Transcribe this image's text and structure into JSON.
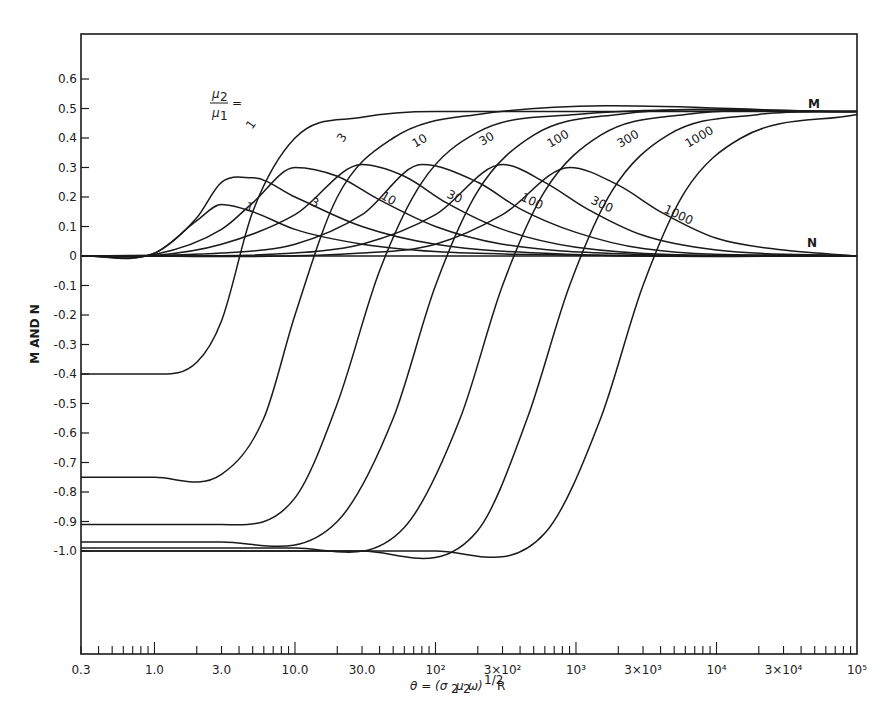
{
  "chart_data": {
    "type": "line",
    "title": "",
    "xlabel": "θ = (σ₂μ₂ω)^1/2 R",
    "ylabel": "M AND N",
    "xscale": "log",
    "xlim": [
      0.3,
      100000
    ],
    "ylim": [
      -1.4,
      0.7
    ],
    "grid": false,
    "legend_position": "inline",
    "legend_title": "μ₂/μ₁ =",
    "x_tick_labels": [
      "0.3",
      "1.0",
      "3.0",
      "10.0",
      "30.0",
      "10²",
      "3×10²",
      "10³",
      "3×10³",
      "10⁴",
      "3×10⁴",
      "10⁵"
    ],
    "x_tick_values": [
      0.3,
      1,
      3,
      10,
      30,
      100,
      300,
      1000,
      3000,
      10000,
      30000,
      100000
    ],
    "y_tick_labels": [
      "0.6",
      "0.5",
      "0.4",
      "0.3",
      "0.2",
      "0.1",
      "0",
      "-0.1",
      "-0.2",
      "-0.3",
      "-0.4",
      "-0.5",
      "-0.6",
      "-0.7",
      "-0.8",
      "-0.9",
      "-1.0"
    ],
    "y_tick_values": [
      0.6,
      0.5,
      0.4,
      0.3,
      0.2,
      0.1,
      0,
      -0.1,
      -0.2,
      -0.3,
      -0.4,
      -0.5,
      -0.6,
      -0.7,
      -0.8,
      -0.9,
      -1.0
    ],
    "curve_family_labels": [
      "M",
      "N"
    ],
    "ratios": [
      "1",
      "3",
      "10",
      "30",
      "100",
      "300",
      "1000"
    ],
    "series": [
      {
        "name": "M, μ₂/μ₁=1",
        "family": "M",
        "ratio": "1",
        "x": [
          0.3,
          1,
          2,
          3,
          5,
          10,
          30,
          100,
          100000.0
        ],
        "values": [
          -0.4,
          -0.4,
          -0.36,
          -0.22,
          0.15,
          0.4,
          0.47,
          0.49,
          0.49
        ]
      },
      {
        "name": "M, μ₂/μ₁=3",
        "family": "M",
        "ratio": "3",
        "x": [
          0.3,
          1,
          3,
          6,
          10,
          20,
          50,
          200,
          100000.0
        ],
        "values": [
          -0.75,
          -0.75,
          -0.74,
          -0.55,
          -0.2,
          0.2,
          0.4,
          0.48,
          0.49
        ]
      },
      {
        "name": "M, μ₂/μ₁=10",
        "family": "M",
        "ratio": "10",
        "x": [
          0.3,
          3,
          10,
          20,
          40,
          80,
          200,
          1000,
          100000.0
        ],
        "values": [
          -0.91,
          -0.91,
          -0.82,
          -0.5,
          -0.05,
          0.25,
          0.42,
          0.48,
          0.49
        ]
      },
      {
        "name": "M, μ₂/μ₁=30",
        "family": "M",
        "ratio": "30",
        "x": [
          0.3,
          3,
          20,
          50,
          100,
          200,
          500,
          2000,
          100000.0
        ],
        "values": [
          -0.97,
          -0.97,
          -0.9,
          -0.55,
          -0.1,
          0.22,
          0.41,
          0.48,
          0.49
        ]
      },
      {
        "name": "M, μ₂/μ₁=100",
        "family": "M",
        "ratio": "100",
        "x": [
          0.3,
          10,
          60,
          150,
          300,
          600,
          1500,
          6000,
          100000.0
        ],
        "values": [
          -0.99,
          -0.99,
          -0.92,
          -0.55,
          -0.1,
          0.22,
          0.41,
          0.48,
          0.49
        ]
      },
      {
        "name": "M, μ₂/μ₁=300",
        "family": "M",
        "ratio": "300",
        "x": [
          0.3,
          30,
          200,
          450,
          900,
          1800,
          4500,
          20000,
          100000.0
        ],
        "values": [
          -1.0,
          -1.0,
          -0.93,
          -0.55,
          -0.1,
          0.22,
          0.41,
          0.48,
          0.49
        ]
      },
      {
        "name": "M, μ₂/μ₁=1000",
        "family": "M",
        "ratio": "1000",
        "x": [
          0.3,
          100,
          600,
          1500,
          3000,
          6000,
          15000,
          100000.0
        ],
        "values": [
          -1.0,
          -1.0,
          -0.94,
          -0.55,
          -0.1,
          0.22,
          0.4,
          0.48
        ]
      },
      {
        "name": "N, μ₂/μ₁=1",
        "family": "N",
        "ratio": "1",
        "x": [
          0.3,
          1,
          2,
          3,
          5,
          10,
          30,
          100,
          1000,
          100000.0
        ],
        "values": [
          0,
          0.01,
          0.12,
          0.175,
          0.15,
          0.09,
          0.04,
          0.015,
          0.003,
          0
        ]
      },
      {
        "name": "N, μ₂/μ₁=3",
        "family": "N",
        "ratio": "3",
        "x": [
          0.3,
          1,
          2,
          3,
          5,
          10,
          30,
          100,
          1000,
          100000.0
        ],
        "values": [
          0,
          0.01,
          0.13,
          0.25,
          0.265,
          0.2,
          0.1,
          0.04,
          0.005,
          0
        ]
      },
      {
        "name": "N, μ₂/μ₁=10",
        "family": "N",
        "ratio": "10",
        "x": [
          0.3,
          1,
          3,
          5,
          10,
          20,
          40,
          100,
          300,
          3000,
          100000.0
        ],
        "values": [
          0,
          0.005,
          0.09,
          0.18,
          0.3,
          0.27,
          0.19,
          0.1,
          0.04,
          0.005,
          0
        ]
      },
      {
        "name": "N, μ₂/μ₁=30",
        "family": "N",
        "ratio": "30",
        "x": [
          0.3,
          1,
          3,
          10,
          30,
          60,
          120,
          300,
          1000,
          100000.0
        ],
        "values": [
          0,
          0.002,
          0.04,
          0.14,
          0.31,
          0.27,
          0.18,
          0.09,
          0.03,
          0
        ]
      },
      {
        "name": "N, μ₂/μ₁=100",
        "family": "N",
        "ratio": "100",
        "x": [
          0.3,
          3,
          10,
          30,
          80,
          200,
          400,
          1000,
          3000,
          100000.0
        ],
        "values": [
          0,
          0.01,
          0.04,
          0.14,
          0.31,
          0.25,
          0.16,
          0.08,
          0.025,
          0
        ]
      },
      {
        "name": "N, μ₂/μ₁=300",
        "family": "N",
        "ratio": "300",
        "x": [
          0.3,
          10,
          30,
          100,
          300,
          600,
          1200,
          3000,
          10000,
          100000.0
        ],
        "values": [
          0,
          0.01,
          0.04,
          0.14,
          0.31,
          0.25,
          0.16,
          0.07,
          0.02,
          0
        ]
      },
      {
        "name": "N, μ₂/μ₁=1000",
        "family": "N",
        "ratio": "1000",
        "x": [
          0.3,
          30,
          100,
          300,
          900,
          2000,
          4000,
          10000,
          30000,
          100000.0
        ],
        "values": [
          0,
          0.01,
          0.04,
          0.14,
          0.3,
          0.24,
          0.15,
          0.06,
          0.02,
          0
        ]
      }
    ],
    "inline_labels": [
      {
        "text": "1",
        "x_px": 252,
        "y_px": 130,
        "rot": -55
      },
      {
        "text": "3",
        "x_px": 343,
        "y_px": 143,
        "rot": -55
      },
      {
        "text": "10",
        "x_px": 415,
        "y_px": 148,
        "rot": -30
      },
      {
        "text": "30",
        "x_px": 482,
        "y_px": 146,
        "rot": -30
      },
      {
        "text": "100",
        "x_px": 550,
        "y_px": 148,
        "rot": -30
      },
      {
        "text": "300",
        "x_px": 620,
        "y_px": 148,
        "rot": -30
      },
      {
        "text": "1000",
        "x_px": 688,
        "y_px": 148,
        "rot": -30
      },
      {
        "text": "1",
        "x_px": 245,
        "y_px": 210,
        "rot": 15
      },
      {
        "text": "3",
        "x_px": 310,
        "y_px": 205,
        "rot": 20
      },
      {
        "text": "10",
        "x_px": 380,
        "y_px": 198,
        "rot": 30
      },
      {
        "text": "30",
        "x_px": 446,
        "y_px": 197,
        "rot": 25
      },
      {
        "text": "100",
        "x_px": 520,
        "y_px": 200,
        "rot": 25
      },
      {
        "text": "300",
        "x_px": 590,
        "y_px": 203,
        "rot": 25
      },
      {
        "text": "1000",
        "x_px": 663,
        "y_px": 212,
        "rot": 25
      },
      {
        "text": "M",
        "x_px": 808,
        "y_px": 108,
        "rot": 0
      },
      {
        "text": "N",
        "x_px": 807,
        "y_px": 247,
        "rot": 0
      }
    ]
  }
}
